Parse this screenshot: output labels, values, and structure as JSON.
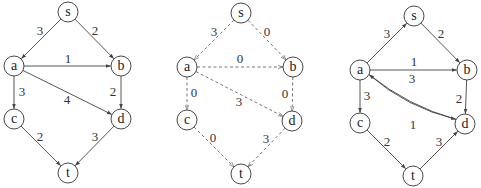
{
  "graphs": [
    {
      "id": "original-network",
      "style": "solid",
      "nodes": [
        {
          "id": "s",
          "label": "s",
          "x": 68,
          "y": 12
        },
        {
          "id": "a",
          "label": "a",
          "x": 14,
          "y": 66
        },
        {
          "id": "b",
          "label": "b",
          "x": 121,
          "y": 66
        },
        {
          "id": "c",
          "label": "c",
          "x": 14,
          "y": 119
        },
        {
          "id": "d",
          "label": "d",
          "x": 121,
          "y": 119
        },
        {
          "id": "t",
          "label": "t",
          "x": 68,
          "y": 173
        }
      ],
      "edges": [
        {
          "from": "s",
          "to": "a",
          "label": "3",
          "lx": 40,
          "ly": 30
        },
        {
          "from": "s",
          "to": "b",
          "label": "2",
          "lx": 95,
          "ly": 30
        },
        {
          "from": "a",
          "to": "b",
          "label": "1",
          "lx": 68,
          "ly": 58
        },
        {
          "from": "a",
          "to": "d",
          "label": "4",
          "lx": 67,
          "ly": 99
        },
        {
          "from": "a",
          "to": "c",
          "label": "3",
          "lx": 22,
          "ly": 91
        },
        {
          "from": "b",
          "to": "d",
          "label": "2",
          "lx": 113,
          "ly": 91
        },
        {
          "from": "c",
          "to": "t",
          "label": "2",
          "lx": 40,
          "ly": 136
        },
        {
          "from": "d",
          "to": "t",
          "label": "3",
          "lx": 95,
          "ly": 136
        }
      ]
    },
    {
      "id": "flow-network",
      "style": "dashed",
      "nodes": [
        {
          "id": "s",
          "label": "s",
          "x": 241,
          "y": 13
        },
        {
          "id": "a",
          "label": "a",
          "x": 187,
          "y": 67
        },
        {
          "id": "b",
          "label": "b",
          "x": 293,
          "y": 67
        },
        {
          "id": "c",
          "label": "c",
          "x": 187,
          "y": 120
        },
        {
          "id": "d",
          "label": "d",
          "x": 292,
          "y": 121
        },
        {
          "id": "t",
          "label": "t",
          "x": 241,
          "y": 174
        }
      ],
      "edges": [
        {
          "from": "s",
          "to": "a",
          "label": "3",
          "lx": 214,
          "ly": 31
        },
        {
          "from": "s",
          "to": "b",
          "label": "0",
          "lx": 267,
          "ly": 31
        },
        {
          "from": "a",
          "to": "b",
          "label": "0",
          "lx": 240,
          "ly": 58
        },
        {
          "from": "a",
          "to": "d",
          "label": "3",
          "lx": 239,
          "ly": 101
        },
        {
          "from": "a",
          "to": "c",
          "label": "0",
          "lx": 194,
          "ly": 92
        },
        {
          "from": "b",
          "to": "d",
          "label": "0",
          "lx": 285,
          "ly": 93
        },
        {
          "from": "c",
          "to": "t",
          "label": "0",
          "lx": 213,
          "ly": 137
        },
        {
          "from": "d",
          "to": "t",
          "label": "3",
          "lx": 266,
          "ly": 138
        }
      ]
    },
    {
      "id": "residual-network",
      "style": "solid",
      "nodes": [
        {
          "id": "s",
          "label": "s",
          "x": 414,
          "y": 16
        },
        {
          "id": "a",
          "label": "a",
          "x": 360,
          "y": 70
        },
        {
          "id": "b",
          "label": "b",
          "x": 467,
          "y": 70
        },
        {
          "id": "c",
          "label": "c",
          "x": 360,
          "y": 123
        },
        {
          "id": "d",
          "label": "d",
          "x": 465,
          "y": 124
        },
        {
          "id": "t",
          "label": "t",
          "x": 413,
          "y": 176
        }
      ],
      "edges": [
        {
          "from": "a",
          "to": "s",
          "label": "3",
          "lx": 387,
          "ly": 33
        },
        {
          "from": "s",
          "to": "b",
          "label": "2",
          "lx": 441,
          "ly": 33
        },
        {
          "from": "a",
          "to": "b",
          "label": "1",
          "lx": 414,
          "ly": 61
        },
        {
          "from": "d",
          "to": "a",
          "label": "3",
          "lx": 412,
          "ly": 78,
          "curve": -10
        },
        {
          "from": "a",
          "to": "d",
          "label": "1",
          "lx": 413,
          "ly": 124,
          "curve": 12
        },
        {
          "from": "a",
          "to": "c",
          "label": "3",
          "lx": 367,
          "ly": 95
        },
        {
          "from": "b",
          "to": "d",
          "label": "2",
          "lx": 459,
          "ly": 98
        },
        {
          "from": "c",
          "to": "t",
          "label": "2",
          "lx": 387,
          "ly": 141
        },
        {
          "from": "t",
          "to": "d",
          "label": "3",
          "lx": 439,
          "ly": 141
        }
      ]
    }
  ],
  "node_radius": 10
}
